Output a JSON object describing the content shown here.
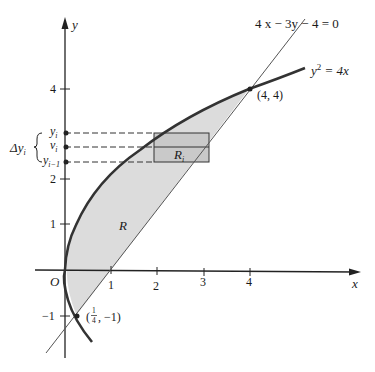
{
  "figure": {
    "equations": {
      "line": "4 x − 3y − 4 = 0",
      "parabola_lhs": "y",
      "parabola_exp": "2",
      "parabola_rhs": " = 4x"
    },
    "points": {
      "upper": "(4, 4)",
      "lower_open": "(",
      "lower_num": "1",
      "lower_den": "4",
      "lower_close": ", −1)"
    },
    "axes": {
      "x_label": "x",
      "y_label": "y",
      "origin": "O",
      "x_ticks": [
        "1",
        "2",
        "3",
        "4"
      ],
      "y_ticks": [
        "4",
        "2",
        "1",
        "−1"
      ]
    },
    "region_labels": {
      "R": "R",
      "Ri": "R",
      "Ri_sub": "i"
    },
    "side_labels": {
      "delta": "Δy",
      "delta_sub": "i",
      "yi": "y",
      "yi_sub": "i",
      "vi": "v",
      "vi_sub": "i",
      "yim1": "y",
      "yim1_sub": "i−1"
    },
    "colors": {
      "shade": "#dcdcdc",
      "rect": "#c8c8c8",
      "curve": "#333333",
      "line": "#555555"
    }
  }
}
